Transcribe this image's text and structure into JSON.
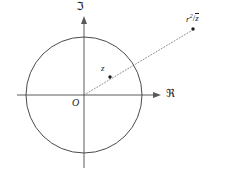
{
  "figure": {
    "background_color": "#ffffff",
    "stroke_color": "#4a4a4a",
    "text_color": "#1c1c1c",
    "width": 226,
    "height": 171
  },
  "axes": {
    "imaginary": {
      "label": "ℑ",
      "name": "imaginary-axis",
      "x": 84,
      "y_top": 16,
      "y_bottom": 168,
      "arrow": "up"
    },
    "real": {
      "label": "ℜ",
      "name": "real-axis",
      "y": 95,
      "x_left": 17,
      "x_right": 161,
      "arrow": "right"
    }
  },
  "origin": {
    "label": "O",
    "x": 84,
    "y": 95
  },
  "circle": {
    "center_x": 84,
    "center_y": 95,
    "radius": 58,
    "stroke": "#4a4a4a"
  },
  "points": [
    {
      "id": "z",
      "label": "z",
      "x": 110,
      "y": 77,
      "inside_circle": true
    },
    {
      "id": "inverse",
      "label_parts": {
        "numerator_base": "r",
        "numerator_exponent": "2",
        "slash": "/",
        "denominator": "z"
      },
      "label_plain": "r²/z̄",
      "x": 193,
      "y": 29,
      "inside_circle": false
    }
  ],
  "ray": {
    "name": "inversion-ray",
    "style": "dotted",
    "from_x": 84,
    "from_y": 95,
    "to_x": 191,
    "to_y": 31
  }
}
